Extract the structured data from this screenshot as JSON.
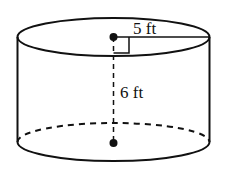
{
  "diagram": {
    "type": "cylinder",
    "labels": {
      "radius": "5 ft",
      "height": "6 ft"
    },
    "colors": {
      "stroke": "#111111",
      "background": "#ffffff"
    }
  }
}
